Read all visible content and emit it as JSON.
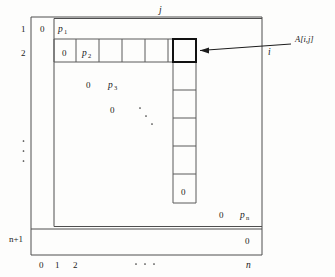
{
  "figure": {
    "title_caption": "",
    "axis_labels": {
      "top": "j",
      "right": "i"
    },
    "row_labels": [
      {
        "text": "1",
        "x": 24,
        "y": 30
      },
      {
        "text": "2",
        "x": 24,
        "y": 54
      },
      {
        "text": "n+1",
        "x": 13,
        "y": 240
      }
    ],
    "row_label_vdots": "⋮",
    "col_labels": [
      {
        "text": "0",
        "x": 42,
        "y": 266
      },
      {
        "text": "1",
        "x": 57,
        "y": 266
      },
      {
        "text": "2",
        "x": 75,
        "y": 266
      },
      {
        "text": "n",
        "x": 248,
        "y": 266
      }
    ],
    "col_label_hdots": "⋯",
    "annotation": {
      "label": "A[i,j]",
      "target_cell_row": 2,
      "target_cell_col": 6
    },
    "cell_values": {
      "row1": [
        {
          "text": "0",
          "x": 42,
          "y": 30
        },
        {
          "text": "p",
          "sub": "1",
          "x": 60,
          "y": 30
        }
      ],
      "row2": [
        {
          "text": "0",
          "x": 64,
          "y": 54
        },
        {
          "text": "p",
          "sub": "2",
          "x": 84,
          "y": 54
        }
      ],
      "row3": [
        {
          "text": "0",
          "x": 88,
          "y": 87
        },
        {
          "text": "p",
          "sub": "3",
          "x": 110,
          "y": 87
        }
      ],
      "row4": [
        {
          "text": "0",
          "x": 112,
          "y": 112
        }
      ],
      "row_n": [
        {
          "text": "0",
          "x": 222,
          "y": 217
        },
        {
          "text": "p",
          "sub": "n",
          "x": 243,
          "y": 217
        }
      ],
      "row_n_plus_1": [
        {
          "text": "0",
          "x": 247,
          "y": 242
        }
      ],
      "column_bottom": [
        {
          "text": "0",
          "x": 188,
          "y": 196
        }
      ]
    },
    "diagonal_dots": "⋱",
    "colors": {
      "background": "#fdfdfc",
      "frame_stroke": "#4e4e4e",
      "cell_stroke": "#5a5a5a",
      "highlight_stroke": "#111111",
      "text": "#1a1a1a",
      "arrow": "#1c1c1c"
    }
  }
}
